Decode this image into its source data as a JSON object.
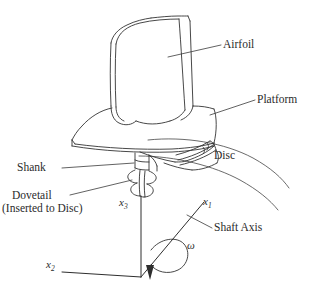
{
  "figure": {
    "background_color": "#ffffff",
    "line_color": "#333333",
    "text_color": "#2b2b2b"
  },
  "labels": {
    "airfoil": "Airfoil",
    "platform": "Platform",
    "shank": "Shank",
    "dovetail_line1": "Dovetail",
    "dovetail_line2": "(Inserted to Disc)",
    "disc": "Disc",
    "shaft_axis": "Shaft Axis"
  },
  "axes": {
    "x1_name": "x",
    "x1_sub": "1",
    "x2_name": "x",
    "x2_sub": "2",
    "x3_name": "x",
    "x3_sub": "3",
    "omega": "ω"
  }
}
